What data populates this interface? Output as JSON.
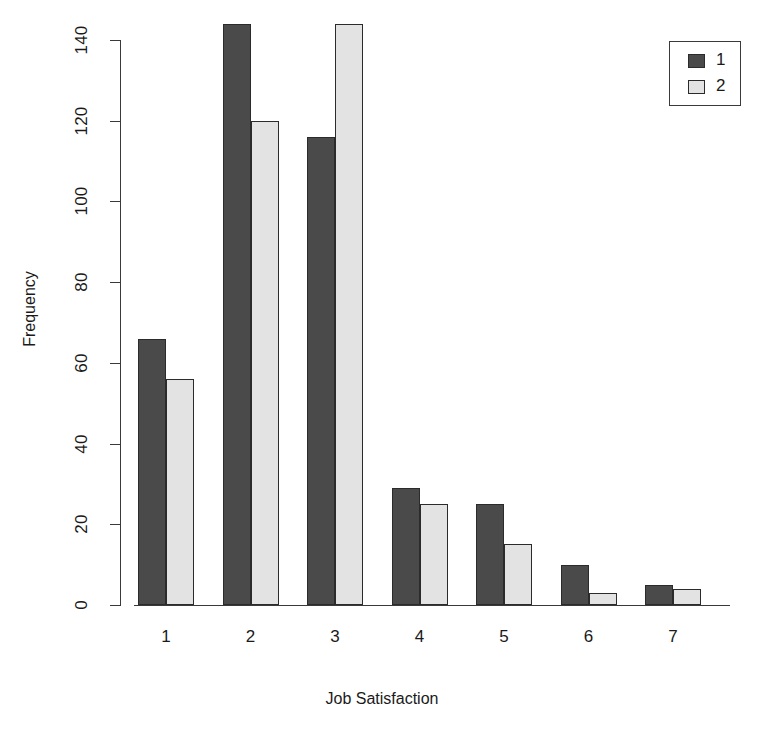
{
  "chart_data": {
    "type": "bar",
    "title": "",
    "xlabel": "Job Satisfaction",
    "ylabel": "Frequency",
    "categories": [
      "1",
      "2",
      "3",
      "4",
      "5",
      "6",
      "7"
    ],
    "series": [
      {
        "name": "1",
        "color": "#4a4a4a",
        "values": [
          66,
          144,
          116,
          29,
          25,
          10,
          5
        ]
      },
      {
        "name": "2",
        "color": "#e3e3e3",
        "values": [
          56,
          120,
          144,
          25,
          15,
          3,
          4
        ]
      }
    ],
    "ylim": [
      0,
      140
    ],
    "yticks": [
      0,
      20,
      40,
      60,
      80,
      100,
      120,
      140
    ],
    "ytick_labels": [
      "0",
      "20",
      "40",
      "60",
      "80",
      "100",
      "120",
      "140"
    ],
    "grid": false,
    "legend": {
      "position": "top-right",
      "entries": [
        "1",
        "2"
      ]
    },
    "bar_style": "grouped",
    "background": "#ffffff",
    "axis_color": "#3a3a3a"
  },
  "axes": {
    "x_title": "Job Satisfaction",
    "y_title": "Frequency"
  },
  "legend": {
    "entry_1": "1",
    "entry_2": "2"
  }
}
